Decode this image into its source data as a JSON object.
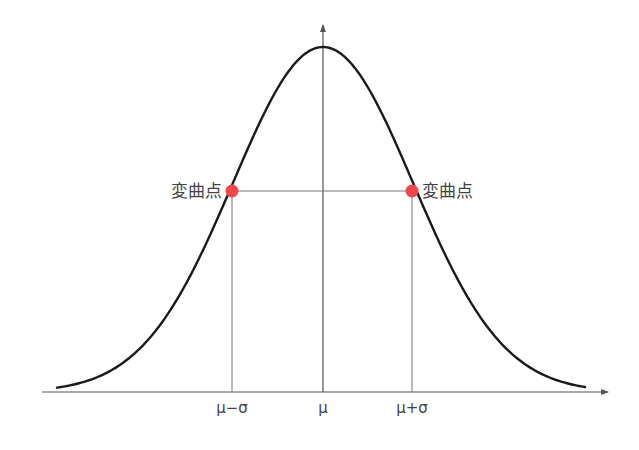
{
  "diagram": {
    "title": "",
    "colors": {
      "curve": "#1a1a1a",
      "axis": "#555555",
      "guide_lines": "#777777",
      "inflection_point": "#f04848",
      "text": "#444444"
    },
    "curve": {
      "type": "gaussian",
      "mu_px": 323,
      "sigma_px": 90,
      "baseline_y": 392,
      "peak_y": 47,
      "x_start": 57,
      "x_end": 585
    },
    "axes": {
      "x_axis": {
        "x_from": 42,
        "x_to": 608,
        "y": 392,
        "arrow": true
      },
      "y_axis": {
        "x": 323,
        "y_from": 392,
        "y_to": 25,
        "arrow": true
      }
    },
    "inflection_points": [
      {
        "label": "変曲点",
        "x": 232,
        "y": 191,
        "label_side": "left"
      },
      {
        "label": "変曲点",
        "x": 412,
        "y": 191,
        "label_side": "right"
      }
    ],
    "tick_labels": [
      {
        "text": "μ−σ",
        "x": 232
      },
      {
        "text": "μ",
        "x": 323
      },
      {
        "text": "μ+σ",
        "x": 412
      }
    ]
  }
}
